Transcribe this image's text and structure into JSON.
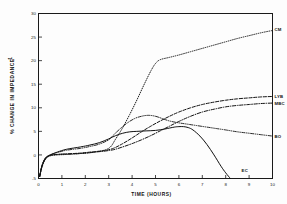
{
  "figure": {
    "background_color": "#fdfdfd",
    "ink_color": "#111111"
  },
  "axes": {
    "x_title": "TIME     (HOURS)",
    "y_title": "% CHANGE IN IMPEDANCE",
    "y_title_suffix": "-1",
    "x_ticklabels": [
      "0",
      "1",
      "2",
      "3",
      "4",
      "5",
      "6",
      "7",
      "8",
      "9",
      "10"
    ],
    "y_ticklabels": [
      "30",
      "25",
      "20",
      "15",
      "10",
      "5",
      "0",
      "-5"
    ]
  },
  "series_labels": {
    "cm": "CM",
    "lyb": "LYB",
    "mbc": "MBC",
    "bo": "BO",
    "ec": "EC"
  },
  "chart_data": {
    "type": "line",
    "title": "",
    "xlabel": "TIME     (HOURS)",
    "ylabel": "% CHANGE IN IMPEDANCE",
    "xlim": [
      0,
      10
    ],
    "ylim": [
      -5,
      30
    ],
    "xticks": [
      0,
      1,
      2,
      3,
      4,
      5,
      6,
      7,
      8,
      9,
      10
    ],
    "yticks": [
      -5,
      0,
      5,
      10,
      15,
      20,
      25,
      30
    ],
    "grid": false,
    "legend": "inline-right-end-labels",
    "series": [
      {
        "name": "CM",
        "linestyle": "dotted",
        "label_position": {
          "x": 10.0,
          "y": 26.6
        },
        "x": [
          0.05,
          0.15,
          0.3,
          0.5,
          0.8,
          1.2,
          1.8,
          2.4,
          3.0,
          3.3,
          3.6,
          3.9,
          4.2,
          4.5,
          4.8,
          5.0,
          5.2,
          5.6,
          6.0,
          6.5,
          7.0,
          7.5,
          8.0,
          8.5,
          9.0,
          9.5,
          10.0
        ],
        "y": [
          -4.6,
          -2.6,
          -0.9,
          -0.2,
          0.0,
          0.1,
          0.3,
          0.6,
          1.4,
          3.4,
          5.8,
          8.6,
          11.6,
          14.8,
          17.8,
          19.4,
          20.2,
          20.7,
          21.2,
          21.9,
          22.6,
          23.3,
          24.0,
          24.7,
          25.3,
          25.9,
          26.4
        ]
      },
      {
        "name": "LYB",
        "linestyle": "dashed",
        "label_position": {
          "x": 10.0,
          "y": 12.4
        },
        "x": [
          0.05,
          0.15,
          0.3,
          0.5,
          0.8,
          1.2,
          1.8,
          2.4,
          2.8,
          3.2,
          3.6,
          4.0,
          4.4,
          4.8,
          5.2,
          5.6,
          6.0,
          6.5,
          7.0,
          7.5,
          8.0,
          8.5,
          9.0,
          9.5,
          10.0
        ],
        "y": [
          -4.6,
          -2.4,
          -0.8,
          -0.1,
          0.1,
          0.2,
          0.4,
          0.7,
          0.9,
          1.4,
          2.4,
          3.6,
          4.9,
          6.1,
          7.2,
          8.2,
          9.1,
          10.0,
          10.7,
          11.2,
          11.6,
          11.9,
          12.1,
          12.3,
          12.4
        ]
      },
      {
        "name": "MBC",
        "linestyle": "dashdot",
        "label_position": {
          "x": 10.0,
          "y": 11.0
        },
        "x": [
          0.05,
          0.15,
          0.3,
          0.5,
          0.8,
          1.2,
          1.8,
          2.4,
          2.8,
          3.2,
          3.6,
          4.0,
          4.4,
          4.8,
          5.2,
          5.6,
          6.0,
          6.5,
          7.0,
          7.5,
          8.0,
          8.5,
          9.0,
          9.5,
          10.0
        ],
        "y": [
          -4.6,
          -2.3,
          -0.7,
          -0.1,
          0.1,
          0.2,
          0.3,
          0.6,
          0.8,
          1.1,
          1.7,
          2.4,
          3.2,
          4.1,
          5.1,
          6.1,
          7.1,
          8.2,
          9.1,
          9.7,
          10.2,
          10.5,
          10.7,
          10.9,
          11.0
        ]
      },
      {
        "name": "BO",
        "linestyle": "dashdotdot",
        "label_position": {
          "x": 10.0,
          "y": 4.0
        },
        "x": [
          0.05,
          0.15,
          0.3,
          0.5,
          0.8,
          1.2,
          1.8,
          2.2,
          2.6,
          3.0,
          3.2,
          3.5,
          3.8,
          4.1,
          4.4,
          4.7,
          5.0,
          5.3,
          5.6,
          6.0,
          6.4,
          6.8,
          7.2,
          7.6,
          8.0,
          8.5,
          9.0,
          9.5,
          10.0
        ],
        "y": [
          -4.5,
          -2.2,
          -0.6,
          0.0,
          0.5,
          1.0,
          1.4,
          1.8,
          2.3,
          3.2,
          4.2,
          5.6,
          6.8,
          7.7,
          8.2,
          8.4,
          8.2,
          7.7,
          7.2,
          6.8,
          6.5,
          6.2,
          5.9,
          5.6,
          5.3,
          4.9,
          4.6,
          4.3,
          4.0
        ]
      },
      {
        "name": "EC",
        "linestyle": "solid",
        "label_position": {
          "x": 8.55,
          "y": -3.2
        },
        "x": [
          0.05,
          0.15,
          0.3,
          0.5,
          0.8,
          1.2,
          1.8,
          2.2,
          2.6,
          3.0,
          3.3,
          3.6,
          3.9,
          4.2,
          4.6,
          5.0,
          5.4,
          5.8,
          6.0,
          6.2,
          6.4,
          6.6,
          6.9,
          7.2,
          7.5,
          7.8,
          8.0,
          8.2
        ],
        "y": [
          -4.5,
          -2.3,
          -0.7,
          0.0,
          0.6,
          1.2,
          1.7,
          2.1,
          2.6,
          3.4,
          4.1,
          4.6,
          4.9,
          5.0,
          5.1,
          5.2,
          5.5,
          5.9,
          6.0,
          6.0,
          5.8,
          5.3,
          4.0,
          2.2,
          0.0,
          -2.4,
          -3.8,
          -5.0
        ]
      }
    ]
  }
}
